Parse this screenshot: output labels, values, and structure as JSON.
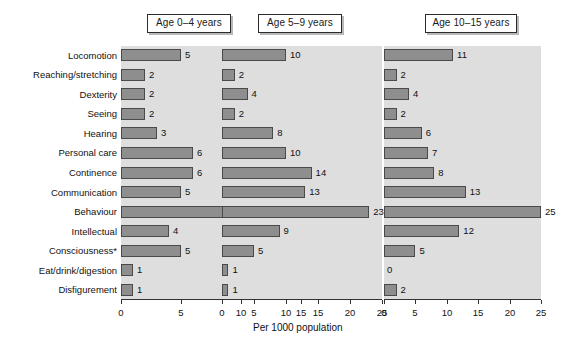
{
  "chart_data": {
    "type": "bar",
    "title": "",
    "xlabel": "Per 1000 population",
    "ylabel": "",
    "orientation": "horizontal",
    "grid": false,
    "legend": "none",
    "categories": [
      "Locomotion",
      "Reaching/stretching",
      "Dexterity",
      "Seeing",
      "Hearing",
      "Personal care",
      "Continence",
      "Communication",
      "Behaviour",
      "Intellectual",
      "Consciousness*",
      "Eat/drink/digestion",
      "Disfigurement"
    ],
    "panels": [
      {
        "title": "Age 0–4 years",
        "xlim": [
          0,
          15
        ],
        "xticks": [
          0,
          5,
          10,
          15
        ],
        "xticklabels": [
          "0",
          "5",
          "10",
          "15"
        ],
        "values": [
          5,
          2,
          2,
          2,
          3,
          6,
          6,
          5,
          13,
          4,
          5,
          1,
          1
        ]
      },
      {
        "title": "Age 5–9 years",
        "xlim": [
          0,
          25
        ],
        "xticks": [
          0,
          5,
          10,
          15,
          20,
          25
        ],
        "xticklabels": [
          "0",
          "5",
          "10",
          "15",
          "20",
          "25"
        ],
        "values": [
          10,
          2,
          4,
          2,
          8,
          10,
          14,
          13,
          23,
          9,
          5,
          1,
          1
        ]
      },
      {
        "title": "Age 10–15 years",
        "xlim": [
          0,
          25
        ],
        "xticks": [
          0,
          5,
          10,
          15,
          20,
          25
        ],
        "xticklabels": [
          "0",
          "5",
          "10",
          "15",
          "20",
          "25"
        ],
        "values": [
          11,
          2,
          4,
          2,
          6,
          7,
          8,
          13,
          25,
          12,
          5,
          0,
          2
        ]
      }
    ],
    "colors": {
      "bar_fill": "#8e8e8e",
      "bar_edge": "#4a4a4a",
      "panel_background": "#dedede",
      "figure_background": "#ffffff",
      "text": "#111111"
    }
  }
}
